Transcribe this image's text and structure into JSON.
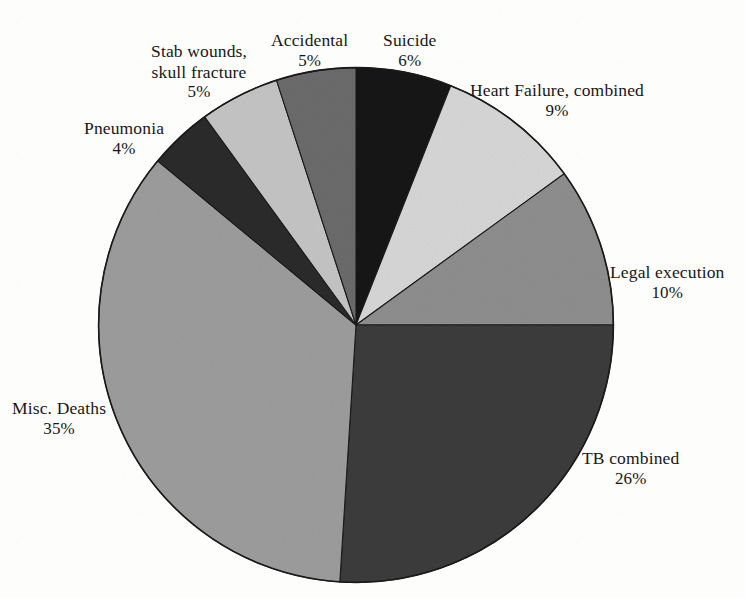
{
  "figure": {
    "title_partial": "",
    "background_color": "#fdfdfc",
    "ink_color": "#171717"
  },
  "chart_data": {
    "type": "pie",
    "title": "",
    "subtitle": "",
    "xlabel": "",
    "ylabel": "",
    "legend_position": "none",
    "grid": false,
    "labels_outside": true,
    "start_angle_deg": 0,
    "direction": "clockwise",
    "total_percent": 100,
    "categories": [
      "Suicide",
      "Heart Failure, combined",
      "Legal execution",
      "TB combined",
      "Misc. Deaths",
      "Pneumonia",
      "Stab wounds, skull fracture",
      "Accidental"
    ],
    "values": [
      6,
      9,
      10,
      26,
      35,
      4,
      5,
      5
    ],
    "value_labels": [
      "6%",
      "9%",
      "10%",
      "26%",
      "35%",
      "4%",
      "5%",
      "5%"
    ],
    "colors": [
      "#141414",
      "#d6d6d6",
      "#8e8e8e",
      "#3c3c3c",
      "#9c9c9c",
      "#2c2c2c",
      "#c4c4c4",
      "#6b6b6b"
    ],
    "slices": [
      {
        "id": "suicide",
        "name": "Suicide",
        "name_line1": "Suicide",
        "name_line2": "",
        "percent": 6,
        "percent_label": "6%",
        "color": "#141414"
      },
      {
        "id": "heart-failure",
        "name": "Heart Failure, combined",
        "name_line1": "Heart Failure, combined",
        "name_line2": "",
        "percent": 9,
        "percent_label": "9%",
        "color": "#d6d6d6"
      },
      {
        "id": "legal-execution",
        "name": "Legal execution",
        "name_line1": "Legal execution",
        "name_line2": "",
        "percent": 10,
        "percent_label": "10%",
        "color": "#8e8e8e"
      },
      {
        "id": "tb-combined",
        "name": "TB combined",
        "name_line1": "TB combined",
        "name_line2": "",
        "percent": 26,
        "percent_label": "26%",
        "color": "#3c3c3c"
      },
      {
        "id": "misc-deaths",
        "name": "Misc. Deaths",
        "name_line1": "Misc. Deaths",
        "name_line2": "",
        "percent": 35,
        "percent_label": "35%",
        "color": "#9c9c9c"
      },
      {
        "id": "pneumonia",
        "name": "Pneumonia",
        "name_line1": "Pneumonia",
        "name_line2": "",
        "percent": 4,
        "percent_label": "4%",
        "color": "#2c2c2c"
      },
      {
        "id": "stab-wounds",
        "name": "Stab wounds, skull fracture",
        "name_line1": "Stab wounds,",
        "name_line2": "skull fracture",
        "percent": 5,
        "percent_label": "5%",
        "color": "#c4c4c4"
      },
      {
        "id": "accidental",
        "name": "Accidental",
        "name_line1": "Accidental",
        "name_line2": "",
        "percent": 5,
        "percent_label": "5%",
        "color": "#6b6b6b"
      }
    ]
  }
}
